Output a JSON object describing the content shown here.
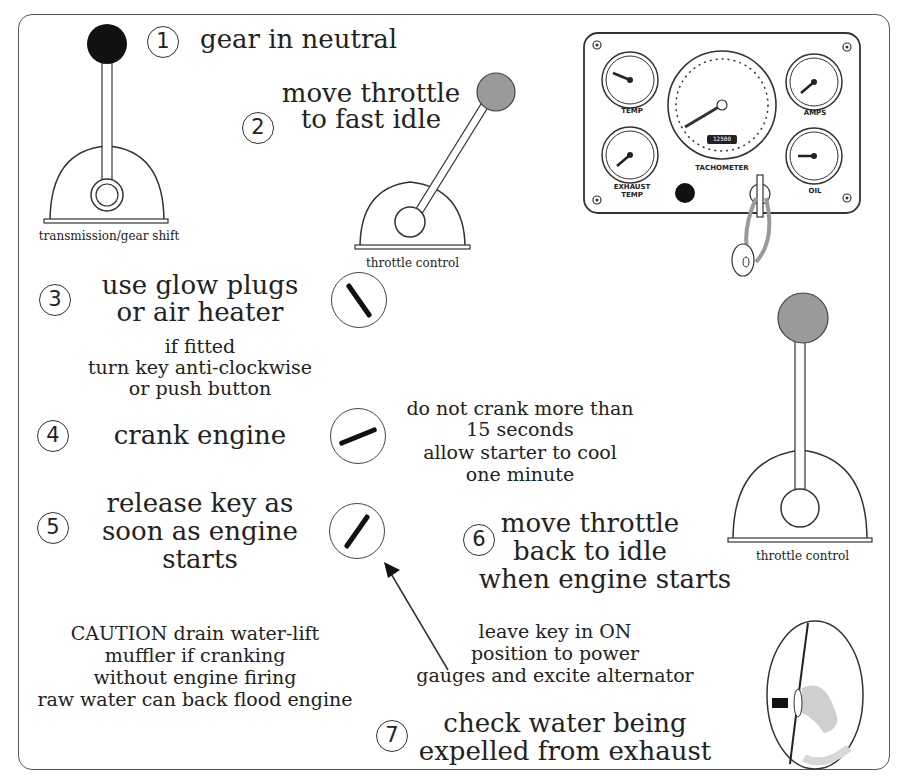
{
  "steps": [
    {
      "number": "1",
      "text": "gear in neutral"
    },
    {
      "number": "2",
      "line1": "move throttle",
      "line2": "to fast idle"
    },
    {
      "number": "3",
      "line1": "use glow plugs",
      "line2": "or air heater",
      "sub1": "if fitted",
      "sub2": "turn key anti-clockwise",
      "sub3": "or push button"
    },
    {
      "number": "4",
      "text": "crank engine"
    },
    {
      "number": "5",
      "line1": "release key as",
      "line2": "soon as engine",
      "line3": "starts"
    },
    {
      "number": "6",
      "line1": "move throttle",
      "line2": "back to idle",
      "line3": "when engine starts"
    },
    {
      "number": "7",
      "line1": "check water being",
      "line2": "expelled from exhaust"
    }
  ],
  "notes": {
    "crank": [
      "do not crank more than",
      "15 seconds",
      "allow starter to cool",
      "one minute"
    ],
    "key_on": [
      "leave key in ON",
      "position to power",
      "gauges and excite alternator"
    ],
    "caution": [
      "CAUTION drain water-lift",
      "muffler if cranking",
      "without engine firing",
      "raw water can back flood engine"
    ]
  },
  "captions": {
    "gear_shift": "transmission/gear shift",
    "throttle_top": "throttle control",
    "throttle_right": "throttle control"
  },
  "panel": {
    "gauges": {
      "temp": "TEMP",
      "exhaust_temp_1": "EXHAUST",
      "exhaust_temp_2": "TEMP",
      "amps": "AMPS",
      "oil": "OIL",
      "tachometer": "TACHOMETER",
      "hour_meter": "12500"
    }
  },
  "colors": {
    "knob_black": "#111111",
    "knob_grey": "#9a9a9a",
    "line": "#333333"
  }
}
